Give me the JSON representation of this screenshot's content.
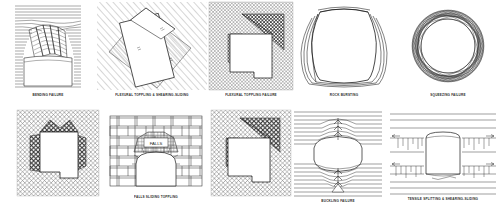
{
  "figure": {
    "panel_count": 9,
    "line_color": "#1a1a1a",
    "hatch_color": "#5a5a5a",
    "shade_color": "#8c8c8c",
    "background": "#ffffff"
  },
  "rows": [
    {
      "name": "top-row",
      "panels": [
        {
          "id": "bending-failure",
          "caption": "BENDING FAILURE",
          "rock_texture": "horizontal-bedded-laminated",
          "opening_shape": "arched-roof-rectangular",
          "annotations": []
        },
        {
          "id": "flexural-toppling-shearing-sliding",
          "caption": "FLEXURAL TOPPLING & SHEARING-SLIDING",
          "rock_texture": "inclined-parallel-joints",
          "opening_shape": "rotated-rectangle",
          "annotations": []
        },
        {
          "id": "flexural-toppling-failure",
          "caption": "FLEXURAL TOPPLING FAILURE",
          "rock_texture": "cross-hatched-joints",
          "opening_shape": "rectangular-with-notch",
          "annotations": []
        },
        {
          "id": "rock-bursting",
          "caption": "ROCK BURSTING",
          "rock_texture": "spalling-slabs",
          "opening_shape": "rounded-square",
          "annotations": []
        },
        {
          "id": "squeezing-failure",
          "caption": "SQUEEZING FAILURE",
          "rock_texture": "overlapping-deformed-rings",
          "opening_shape": "circular",
          "annotations": []
        }
      ]
    },
    {
      "name": "bottom-row",
      "panels": [
        {
          "id": "falls-sliding-toppling",
          "caption": "FALLS  SLIDING  TOPPLING",
          "rock_texture": "blocky-cross-jointed",
          "opening_shape": "rectangular-with-notch",
          "annotations": []
        },
        {
          "id": "falls-masonry-arch",
          "caption": "FALLS  SLIDING  TOPPLING",
          "rock_texture": "running-bond-masonry",
          "opening_shape": "arched-opening",
          "annotations": [
            "FALLS"
          ]
        },
        {
          "id": "buckling-failure",
          "caption": "BUCKLING FAILURE",
          "rock_texture": "horizontal-bedded-laminated",
          "opening_shape": "barrel-lens",
          "annotations": []
        },
        {
          "id": "tensile-splitting-shearing-sliding",
          "caption": "TENSILE SPLITTING & SHEARING-SLIDING",
          "rock_texture": "horizontal-beds-with-vertical-cracks",
          "opening_shape": "rounded-rectangular",
          "annotations": []
        }
      ]
    }
  ]
}
